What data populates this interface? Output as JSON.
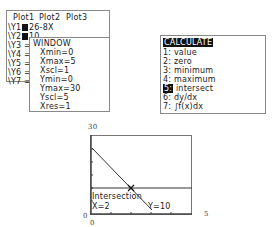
{
  "yequals": {
    "plots": [
      "Plot1",
      "Plot2",
      "Plot3"
    ],
    "rows": [
      {
        "label": "\\Y1",
        "expr": "26-8X",
        "selected": true
      },
      {
        "label": "\\Y2",
        "expr": "10",
        "selected": true
      },
      {
        "label": "\\Y3 =",
        "expr": ""
      },
      {
        "label": "\\Y4 =",
        "expr": ""
      },
      {
        "label": "\\Y5 =",
        "expr": ""
      },
      {
        "label": "\\Y6 =",
        "expr": ""
      },
      {
        "label": "\\Y7 =",
        "expr": ""
      }
    ]
  },
  "window": {
    "title": "WINDOW",
    "items": [
      "Xmin=0",
      "Xmax=5",
      "Xscl=1",
      "Ymin=0",
      "Ymax=30",
      "Yscl=5",
      "Xres=1"
    ]
  },
  "calculate": {
    "title": "CALCULATE",
    "items": [
      {
        "num": "1:",
        "label": "value"
      },
      {
        "num": "2:",
        "label": "zero"
      },
      {
        "num": "3:",
        "label": "minimum"
      },
      {
        "num": "4:",
        "label": "maximum"
      },
      {
        "num": "5:",
        "label": "intersect",
        "selected": true
      },
      {
        "num": "6:",
        "label": "dy/dx"
      },
      {
        "num": "7:",
        "label": "∫f(x)dx"
      }
    ]
  },
  "graph": {
    "ymax_label": "30",
    "ymin_label": "0",
    "xmin_label": "0",
    "xmax_label": "5",
    "result_title": "Intersection",
    "result_x": "X=2",
    "result_y": "Y=10"
  }
}
